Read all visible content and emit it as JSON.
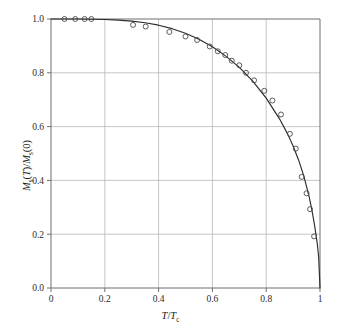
{
  "figure": {
    "background_color": "#ffffff",
    "axis_color": "#6e6e6e",
    "grid_color": "#b8b8b8",
    "curve_color": "#2b2b2b",
    "marker_color": "#4a4a4a"
  },
  "labels": {
    "x_axis_main": "T",
    "x_axis_denom": "T",
    "x_axis_sub": "c",
    "x_axis_full": "T/Tc",
    "y_axis_full": "Ms(T)/Ms(0)",
    "y_axis_m1": "M",
    "y_axis_sub1": "s",
    "y_axis_arg1": "(T)",
    "y_axis_slash": "/",
    "y_axis_m2": "M",
    "y_axis_sub2": "s",
    "y_axis_arg2": "(0)"
  },
  "chart_data": {
    "type": "scatter",
    "title": "",
    "xlabel": "T/Tc",
    "ylabel": "Ms(T)/Ms(0)",
    "xlim": [
      0.0,
      1.0
    ],
    "ylim": [
      0.0,
      1.0
    ],
    "grid": true,
    "legend": "none",
    "xticks": [
      0,
      0.2,
      0.4,
      0.6,
      0.8,
      1
    ],
    "xtick_labels": [
      "0",
      "0.2",
      "0.4",
      "0.6",
      "0.8",
      "1"
    ],
    "yticks": [
      0.0,
      0.2,
      0.4,
      0.6,
      0.8,
      1.0
    ],
    "ytick_labels": [
      "0.0",
      "0.2",
      "0.4",
      "0.6",
      "0.8",
      "1.0"
    ],
    "series": [
      {
        "name": "Brillouin theory curve",
        "type": "line",
        "marker": "none",
        "x": [
          0.0,
          0.05,
          0.1,
          0.15,
          0.2,
          0.25,
          0.3,
          0.35,
          0.4,
          0.45,
          0.5,
          0.55,
          0.6,
          0.65,
          0.7,
          0.75,
          0.8,
          0.85,
          0.88,
          0.9,
          0.92,
          0.94,
          0.96,
          0.97,
          0.98,
          0.99,
          0.995,
          1.0
        ],
        "y": [
          1.0,
          1.0,
          1.0,
          0.999,
          0.998,
          0.996,
          0.992,
          0.986,
          0.977,
          0.964,
          0.947,
          0.925,
          0.897,
          0.862,
          0.82,
          0.769,
          0.706,
          0.628,
          0.572,
          0.528,
          0.477,
          0.416,
          0.338,
          0.289,
          0.232,
          0.164,
          0.116,
          0.0
        ]
      },
      {
        "name": "Experimental data",
        "type": "scatter",
        "marker": "open-circle",
        "x": [
          0.05,
          0.09,
          0.125,
          0.15,
          0.305,
          0.352,
          0.44,
          0.5,
          0.543,
          0.59,
          0.62,
          0.648,
          0.672,
          0.7,
          0.725,
          0.755,
          0.793,
          0.823,
          0.855,
          0.888,
          0.91,
          0.932,
          0.95,
          0.963,
          0.978
        ],
        "y": [
          1.0,
          1.0,
          1.0,
          1.0,
          0.978,
          0.972,
          0.952,
          0.935,
          0.922,
          0.898,
          0.88,
          0.866,
          0.845,
          0.828,
          0.8,
          0.772,
          0.733,
          0.697,
          0.645,
          0.573,
          0.518,
          0.413,
          0.352,
          0.293,
          0.192
        ]
      }
    ]
  }
}
